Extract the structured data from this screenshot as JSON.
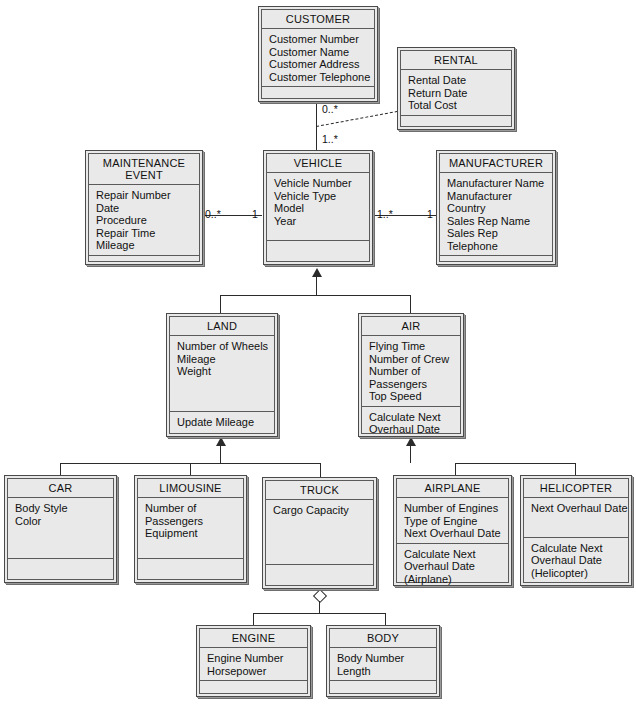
{
  "diagram": {
    "type": "uml-class-diagram",
    "background_color": "#ffffff",
    "box_fill_color": "#e9e9e9",
    "line_color": "#2b2b2b"
  },
  "classes": {
    "customer": {
      "name": "CUSTOMER",
      "attributes": "Customer Number\nCustomer Name\nCustomer Address\nCustomer Telephone",
      "operations": ""
    },
    "rental": {
      "name": "RENTAL",
      "attributes": "Rental Date\nReturn Date\nTotal Cost",
      "operations": ""
    },
    "maintenance_event": {
      "name": "MAINTENANCE\nEVENT",
      "attributes": "Repair Number\nDate\nProcedure\nRepair Time\nMileage",
      "operations": ""
    },
    "vehicle": {
      "name": "VEHICLE",
      "attributes": "Vehicle Number\nVehicle Type\nModel\nYear",
      "operations": ""
    },
    "manufacturer": {
      "name": "MANUFACTURER",
      "attributes": "Manufacturer Name\nManufacturer\n  Country\nSales Rep Name\nSales Rep\n  Telephone",
      "operations": ""
    },
    "land": {
      "name": "LAND",
      "attributes": "Number of Wheels\nMileage\nWeight",
      "operations": "Update Mileage"
    },
    "air": {
      "name": "AIR",
      "attributes": "Flying Time\nNumber of Crew\nNumber of\n  Passengers\nTop Speed",
      "operations": "Calculate Next\n  Overhaul Date"
    },
    "car": {
      "name": "CAR",
      "attributes": "Body Style\nColor",
      "operations": ""
    },
    "limousine": {
      "name": "LIMOUSINE",
      "attributes": "Number of\n  Passengers\nEquipment",
      "operations": ""
    },
    "truck": {
      "name": "TRUCK",
      "attributes": "Cargo Capacity",
      "operations": ""
    },
    "airplane": {
      "name": "AIRPLANE",
      "attributes": "Number of Engines\nType of Engine\nNext Overhaul Date",
      "operations": "Calculate Next\n  Overhaul Date\n  (Airplane)"
    },
    "helicopter": {
      "name": "HELICOPTER",
      "attributes": "Next Overhaul Date",
      "operations": "Calculate Next\n  Overhaul Date\n  (Helicopter)"
    },
    "engine": {
      "name": "ENGINE",
      "attributes": "Engine Number\nHorsepower",
      "operations": ""
    },
    "body": {
      "name": "BODY",
      "attributes": "Body Number\nLength",
      "operations": ""
    }
  },
  "multiplicities": {
    "customer_to_vehicle": "0..*",
    "vehicle_to_customer": "1..*",
    "maintenance_to_vehicle": "0..*",
    "vehicle_to_maintenance": "1",
    "vehicle_to_manufacturer": "1..*",
    "manufacturer_to_vehicle": "1"
  },
  "relationships": [
    {
      "kind": "association",
      "from": "CUSTOMER",
      "to": "VEHICLE",
      "from_mult": "0..*",
      "to_mult": "1..*"
    },
    {
      "kind": "association-class",
      "class": "RENTAL",
      "on": "CUSTOMER-VEHICLE"
    },
    {
      "kind": "association",
      "from": "MAINTENANCE EVENT",
      "to": "VEHICLE",
      "from_mult": "0..*",
      "to_mult": "1"
    },
    {
      "kind": "association",
      "from": "VEHICLE",
      "to": "MANUFACTURER",
      "from_mult": "1..*",
      "to_mult": "1"
    },
    {
      "kind": "generalization",
      "parent": "VEHICLE",
      "children": [
        "LAND",
        "AIR"
      ]
    },
    {
      "kind": "generalization",
      "parent": "LAND",
      "children": [
        "CAR",
        "LIMOUSINE",
        "TRUCK"
      ]
    },
    {
      "kind": "generalization",
      "parent": "AIR",
      "children": [
        "AIRPLANE",
        "HELICOPTER"
      ]
    },
    {
      "kind": "aggregation",
      "whole": "TRUCK",
      "parts": [
        "ENGINE",
        "BODY"
      ]
    }
  ]
}
